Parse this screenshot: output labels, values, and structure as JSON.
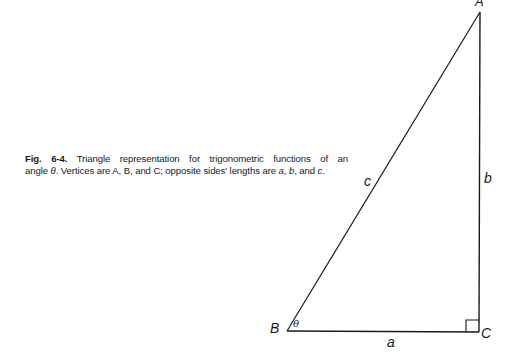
{
  "caption": {
    "fig_label": "Fig. 6-4.",
    "line1_rest": " Triangle representation for trigonometric functions of an",
    "line2_prefix": "angle ",
    "theta": "θ",
    "line2_mid": ". Vertices are A, B, and C; opposite sides' lengths are ",
    "a": "a",
    "sep1": ", ",
    "b": "b",
    "sep2": ", and ",
    "c": "c",
    "end": "."
  },
  "diagram": {
    "vertices": {
      "A": {
        "label": "A",
        "x": 480,
        "y": 12
      },
      "B": {
        "label": "B",
        "x": 287,
        "y": 331
      },
      "C": {
        "label": "C",
        "x": 479,
        "y": 332
      }
    },
    "sides": {
      "a": {
        "label": "a"
      },
      "b": {
        "label": "b"
      },
      "c": {
        "label": "c"
      }
    },
    "angle_label": "θ",
    "right_angle_marker": "square at C",
    "stroke_color": "#1a1a1a"
  }
}
